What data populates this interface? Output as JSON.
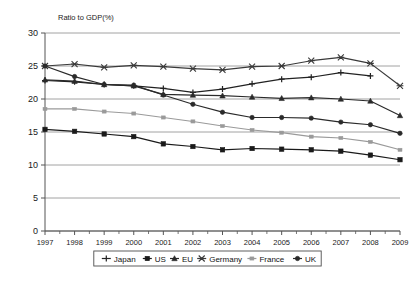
{
  "chart_data": {
    "type": "line",
    "title": "",
    "ylabel": "Ratio to GDP(%)",
    "xlabel": "",
    "ylim": [
      0,
      30
    ],
    "yticks": [
      0,
      5,
      10,
      15,
      20,
      25,
      30
    ],
    "grid": true,
    "legend_position": "bottom",
    "categories": [
      "1997",
      "1998",
      "1999",
      "2000",
      "2001",
      "2002",
      "2003",
      "2004",
      "2005",
      "2006",
      "2007",
      "2008",
      "2009"
    ],
    "x": [
      1997,
      1998,
      1999,
      2000,
      2001,
      2002,
      2003,
      2004,
      2005,
      2006,
      2007,
      2008,
      2009
    ],
    "series": [
      {
        "name": "Japan",
        "marker": "cross-plus",
        "color": "#222222",
        "values": [
          22.8,
          22.6,
          22.2,
          22.0,
          21.6,
          21.0,
          21.5,
          22.3,
          23.0,
          23.3,
          24.0,
          23.5,
          null
        ]
      },
      {
        "name": "US",
        "marker": "square",
        "color": "#1a1a1a",
        "values": [
          15.4,
          15.1,
          14.7,
          14.3,
          13.2,
          12.8,
          12.3,
          12.5,
          12.4,
          12.3,
          12.1,
          11.5,
          10.8
        ]
      },
      {
        "name": "EU",
        "marker": "triangle",
        "color": "#2a2a2a",
        "values": [
          22.9,
          22.7,
          22.2,
          22.0,
          20.7,
          20.6,
          20.5,
          20.3,
          20.1,
          20.2,
          20.0,
          19.7,
          17.5
        ]
      },
      {
        "name": "Germany",
        "marker": "star-x",
        "color": "#3a3a3a",
        "values": [
          25.0,
          25.3,
          24.8,
          25.1,
          24.9,
          24.6,
          24.4,
          24.9,
          25.0,
          25.8,
          26.3,
          25.4,
          22.0
        ]
      },
      {
        "name": "France",
        "marker": "dash-square",
        "color": "#9a9a9a",
        "values": [
          18.5,
          18.5,
          18.1,
          17.8,
          17.2,
          16.6,
          15.9,
          15.3,
          14.9,
          14.3,
          14.1,
          13.5,
          12.3
        ]
      },
      {
        "name": "UK",
        "marker": "dot-circle",
        "color": "#2a2a2a",
        "values": [
          25.0,
          23.4,
          22.2,
          22.1,
          20.6,
          19.2,
          18.0,
          17.2,
          17.2,
          17.1,
          16.5,
          16.1,
          14.8
        ]
      }
    ]
  },
  "legend": {
    "items": [
      {
        "label": "Japan"
      },
      {
        "label": "US"
      },
      {
        "label": "EU"
      },
      {
        "label": "Germany"
      },
      {
        "label": "France"
      },
      {
        "label": "UK"
      }
    ]
  },
  "axes": {
    "y_axis_title": "Ratio to GDP(%)",
    "y_tick_labels": [
      "0",
      "5",
      "10",
      "15",
      "20",
      "25",
      "30"
    ],
    "x_tick_labels": [
      "1997",
      "1998",
      "1999",
      "2000",
      "2001",
      "2002",
      "2003",
      "2004",
      "2005",
      "2006",
      "2007",
      "2008",
      "2009"
    ]
  },
  "style": {
    "background": "#ffffff",
    "grid_color": "#8c8c8c",
    "axis_color": "#555555",
    "text_color": "#1a1a1a",
    "legend_border": "#4d4d4d"
  }
}
